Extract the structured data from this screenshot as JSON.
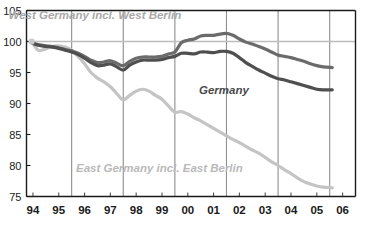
{
  "chart_data": {
    "type": "line",
    "title": "",
    "subtitle": "",
    "xlabel": "",
    "ylabel": "",
    "ylim": [
      75,
      105
    ],
    "xlim": [
      1993.75,
      2006.5
    ],
    "yticks": [
      75,
      80,
      85,
      90,
      95,
      100,
      105
    ],
    "ytick_labels": [
      "75",
      "80",
      "85",
      "90",
      "95",
      "100",
      "105"
    ],
    "xticks": [
      1994,
      1995,
      1996,
      1997,
      1998,
      1999,
      2000,
      2001,
      2002,
      2003,
      2004,
      2005,
      2006
    ],
    "xtick_labels": [
      "94",
      "95",
      "96",
      "97",
      "98",
      "99",
      "00",
      "01",
      "02",
      "03",
      "04",
      "05",
      "06"
    ],
    "gridlines_v": [
      1995.5,
      1997.5,
      1999.5,
      2001.5,
      2003.5,
      2005.5
    ],
    "grid": "vertical-only",
    "reference_line": {
      "value": 100,
      "color": "#bdbdbd"
    },
    "legend": "inline-annotations",
    "annotations": [
      {
        "name": "west-germany-label",
        "text": "West Germany incl. West Berlin",
        "x": 1996.4,
        "y": 103.6,
        "color": "#a8a8a8"
      },
      {
        "name": "germany-label",
        "text": "Germany",
        "x": 2001.4,
        "y": 91.6,
        "color": "#4a4a4a"
      },
      {
        "name": "east-germany-label",
        "text": "East Germany incl. East Berlin",
        "x": 1998.9,
        "y": 79.0,
        "color": "#b9b9b9"
      }
    ],
    "series": [
      {
        "name": "West Germany incl. West Berlin",
        "color": "#6b6b6b",
        "x": [
          1993.95,
          1994.2,
          1994.5,
          1994.75,
          1995.0,
          1995.25,
          1995.5,
          1995.75,
          1996.0,
          1996.25,
          1996.5,
          1996.75,
          1997.0,
          1997.25,
          1997.5,
          1997.75,
          1998.0,
          1998.25,
          1998.5,
          1998.75,
          1999.0,
          1999.25,
          1999.5,
          1999.75,
          2000.0,
          2000.25,
          2000.5,
          2000.75,
          2001.0,
          2001.25,
          2001.5,
          2001.75,
          2002.0,
          2002.25,
          2002.5,
          2002.75,
          2003.0,
          2003.25,
          2003.5,
          2003.75,
          2004.0,
          2004.25,
          2004.5,
          2004.75,
          2005.0,
          2005.25,
          2005.6
        ],
        "values": [
          99.8,
          99.5,
          99.3,
          99.2,
          99.0,
          98.7,
          98.5,
          98.1,
          97.6,
          97.0,
          96.6,
          96.7,
          96.9,
          96.5,
          96.1,
          96.8,
          97.3,
          97.5,
          97.5,
          97.5,
          97.6,
          98.0,
          98.3,
          99.8,
          100.2,
          100.4,
          100.9,
          101.0,
          101.0,
          101.2,
          101.3,
          101.0,
          100.4,
          99.9,
          99.6,
          99.2,
          98.8,
          98.3,
          97.8,
          97.6,
          97.4,
          97.1,
          96.8,
          96.4,
          96.1,
          95.9,
          95.8
        ]
      },
      {
        "name": "Germany",
        "color": "#4f4f4f",
        "x": [
          1993.95,
          1994.2,
          1994.5,
          1994.75,
          1995.0,
          1995.25,
          1995.5,
          1995.75,
          1996.0,
          1996.25,
          1996.5,
          1996.75,
          1997.0,
          1997.25,
          1997.5,
          1997.75,
          1998.0,
          1998.25,
          1998.5,
          1998.75,
          1999.0,
          1999.25,
          1999.5,
          1999.75,
          2000.0,
          2000.25,
          2000.5,
          2000.75,
          2001.0,
          2001.25,
          2001.5,
          2001.75,
          2002.0,
          2002.25,
          2002.5,
          2002.75,
          2003.0,
          2003.25,
          2003.5,
          2003.75,
          2004.0,
          2004.25,
          2004.5,
          2004.75,
          2005.0,
          2005.25,
          2005.6
        ],
        "values": [
          99.8,
          99.4,
          99.2,
          99.1,
          98.9,
          98.6,
          98.3,
          97.9,
          97.3,
          96.6,
          96.1,
          96.2,
          96.4,
          95.9,
          95.4,
          96.2,
          96.7,
          97.0,
          97.0,
          97.0,
          97.1,
          97.4,
          97.6,
          98.1,
          98.1,
          98.0,
          98.3,
          98.3,
          98.2,
          98.4,
          98.4,
          98.1,
          97.4,
          96.6,
          96.0,
          95.4,
          94.9,
          94.4,
          94.0,
          93.8,
          93.5,
          93.2,
          92.9,
          92.6,
          92.3,
          92.2,
          92.2
        ]
      },
      {
        "name": "East Germany incl. East Berlin",
        "color": "#c4c4c4",
        "x": [
          1993.95,
          1994.2,
          1994.5,
          1994.75,
          1995.0,
          1995.25,
          1995.5,
          1995.75,
          1996.0,
          1996.25,
          1996.5,
          1996.75,
          1997.0,
          1997.25,
          1997.5,
          1997.75,
          1998.0,
          1998.25,
          1998.5,
          1998.75,
          1999.0,
          1999.25,
          1999.5,
          1999.75,
          2000.0,
          2000.25,
          2000.5,
          2000.75,
          2001.0,
          2001.25,
          2001.5,
          2001.75,
          2002.0,
          2002.25,
          2002.5,
          2002.75,
          2003.0,
          2003.25,
          2003.5,
          2003.75,
          2004.0,
          2004.25,
          2004.5,
          2004.75,
          2005.0,
          2005.25,
          2005.6
        ],
        "values": [
          100.0,
          98.6,
          98.8,
          99.2,
          99.3,
          99.1,
          98.6,
          97.6,
          96.4,
          95.0,
          94.1,
          93.5,
          92.7,
          91.6,
          90.6,
          91.3,
          92.0,
          92.3,
          92.0,
          91.3,
          90.7,
          89.6,
          88.6,
          88.7,
          88.3,
          87.7,
          87.2,
          86.6,
          86.0,
          85.4,
          84.8,
          84.2,
          83.7,
          83.1,
          82.5,
          82.0,
          81.3,
          80.6,
          80.0,
          79.3,
          78.7,
          78.0,
          77.4,
          77.0,
          76.7,
          76.5,
          76.4
        ]
      }
    ]
  }
}
